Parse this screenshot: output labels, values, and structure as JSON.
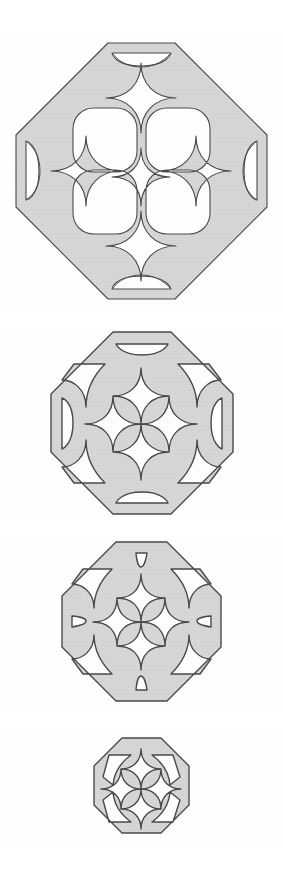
{
  "document": {
    "title": "Octagonal Lattice Panel Plate",
    "background_color": "#ffffff",
    "width": 283,
    "height": 882,
    "caption": ""
  },
  "style": {
    "fill_color": "#d6d6d4",
    "outline_color": "#4a4a4a",
    "stroke_width": 1.1,
    "background_color": "#ffffff"
  },
  "figures": [
    {
      "id": "panel-1",
      "label": "",
      "order": 1,
      "size_rank": "largest",
      "outline_shape": "octagon",
      "orientation": "diamond",
      "center_x": 142,
      "center_y": 171,
      "width": 251,
      "height": 256,
      "grid": "2x2",
      "octagonal_openings": 4,
      "star_cutouts": 5,
      "corner_crescents": 4,
      "border_band_width": 16
    },
    {
      "id": "panel-2",
      "label": "",
      "order": 2,
      "size_rank": "large",
      "outline_shape": "octagon",
      "orientation": "diamond",
      "center_x": 142,
      "center_y": 423,
      "width": 186,
      "height": 186,
      "grid": "1x1-quatrefoil",
      "octagonal_openings": 0,
      "star_cutouts": 1,
      "corner_crescents": 4,
      "border_band_width": 12
    },
    {
      "id": "panel-3",
      "label": "",
      "order": 3,
      "size_rank": "medium",
      "outline_shape": "octagon",
      "orientation": "diamond",
      "center_x": 142,
      "center_y": 621,
      "width": 160,
      "height": 160,
      "grid": "1x1-quatrefoil",
      "octagonal_openings": 0,
      "star_cutouts": 1,
      "corner_crescents": 4,
      "border_band_width": 10
    },
    {
      "id": "panel-4",
      "label": "",
      "order": 4,
      "size_rank": "smallest",
      "outline_shape": "octagon",
      "orientation": "flat",
      "center_x": 141,
      "center_y": 789,
      "width": 99,
      "height": 104,
      "grid": "ring",
      "octagonal_openings": 0,
      "star_cutouts": 1,
      "corner_crescents": 4,
      "border_band_width": 11
    }
  ]
}
